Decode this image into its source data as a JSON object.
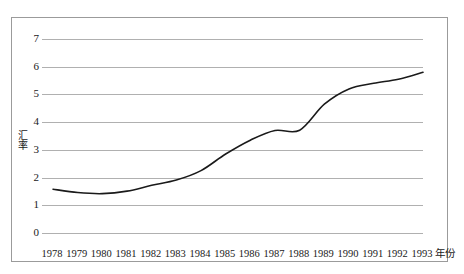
{
  "figure": {
    "top_faint_text": "",
    "background_color": "#ffffff",
    "frame_border_color": "#9b9b9b",
    "gridline_color": "#b0b0b0",
    "line_color": "#1a1a1a"
  },
  "chart_data": {
    "type": "line",
    "title": "",
    "xlabel": "年份",
    "ylabel": "汇率",
    "x": [
      1978,
      1979,
      1980,
      1981,
      1982,
      1983,
      1984,
      1985,
      1986,
      1987,
      1988,
      1989,
      1990,
      1991,
      1992,
      1993
    ],
    "categories": [
      "1978",
      "1979",
      "1980",
      "1981",
      "1982",
      "1983",
      "1984",
      "1985",
      "1986",
      "1987",
      "1988",
      "1989",
      "1990",
      "1991",
      "1992",
      "1993"
    ],
    "values": [
      1.58,
      1.46,
      1.42,
      1.51,
      1.72,
      1.91,
      2.25,
      2.85,
      3.35,
      3.7,
      3.71,
      4.65,
      5.2,
      5.4,
      5.55,
      5.8
    ],
    "series": [
      {
        "name": "汇率",
        "values": [
          1.58,
          1.46,
          1.42,
          1.51,
          1.72,
          1.91,
          2.25,
          2.85,
          3.35,
          3.7,
          3.71,
          4.65,
          5.2,
          5.4,
          5.55,
          5.8
        ]
      }
    ],
    "ylim": [
      0,
      7
    ],
    "yticks": [
      0,
      1,
      2,
      3,
      4,
      5,
      6,
      7
    ],
    "ytick_labels": [
      "0",
      "1",
      "2",
      "3",
      "4",
      "5",
      "6",
      "7"
    ],
    "xlim": [
      1978,
      1993
    ],
    "grid": "horizontal",
    "legend": "none",
    "smoothed": true
  }
}
